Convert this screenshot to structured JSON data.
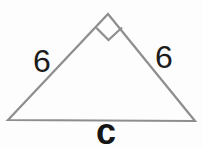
{
  "figure": {
    "type": "right-triangle-diagram",
    "colors": {
      "background": "#fdfdfd",
      "stroke": "#8e8e8e",
      "label": "#1c1c1c"
    },
    "triangle": {
      "points": "8,120 108,14 195,121"
    },
    "right_angle_marker": {
      "points": "96.5,28 108.5,40 122,27.5"
    },
    "labels": {
      "left_side": "6",
      "right_side": "6",
      "base": "c"
    }
  }
}
